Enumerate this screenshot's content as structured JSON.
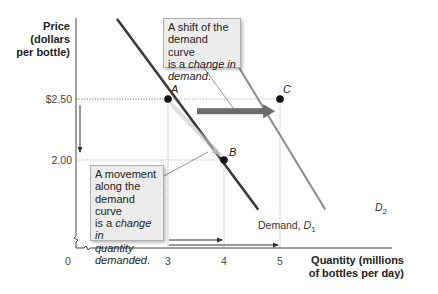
{
  "chart_data": {
    "type": "line",
    "title": "",
    "xlabel": "Quantity (millions of bottles per day)",
    "xlabel_lines": [
      "Quantity (millions",
      "of bottles per day)"
    ],
    "ylabel": "Price (dollars per bottle)",
    "ylabel_lines": [
      "Price",
      "(dollars",
      "per bottle)"
    ],
    "origin_label": "0",
    "x_ticks": [
      {
        "value": 3,
        "label": "3"
      },
      {
        "value": 4,
        "label": "4"
      },
      {
        "value": 5,
        "label": "5"
      }
    ],
    "y_ticks": [
      {
        "value": 2.5,
        "label": "$2.50"
      },
      {
        "value": 2.0,
        "label": "2.00"
      }
    ],
    "xlim": [
      0,
      7
    ],
    "ylim": [
      1.5,
      3.0
    ],
    "axis_break": true,
    "grid": false,
    "series": [
      {
        "name": "Demand, D1",
        "label_text": "Demand, ",
        "label_symbol": "D",
        "label_sub": "1",
        "color": "#3a3a3a",
        "points": [
          [
            2.1,
            3.15
          ],
          [
            4.6,
            1.6
          ]
        ]
      },
      {
        "name": "D2",
        "label_text": "",
        "label_symbol": "D",
        "label_sub": "2",
        "color": "#8f8f8f",
        "points": [
          [
            3.75,
            3.15
          ],
          [
            5.8,
            1.6
          ]
        ]
      }
    ],
    "points": [
      {
        "label": "A",
        "x": 3,
        "y": 2.5
      },
      {
        "label": "B",
        "x": 4,
        "y": 2.0
      },
      {
        "label": "C",
        "x": 5,
        "y": 2.5
      }
    ],
    "arrows": [
      {
        "name": "shift-arrow",
        "from": [
          3.5,
          2.4
        ],
        "to": [
          4.95,
          2.4
        ],
        "style": "thick"
      },
      {
        "name": "price-drop-arrow",
        "axis": "y",
        "from": 2.45,
        "to": 2.05
      },
      {
        "name": "quantity-3-to-4-arrow",
        "axis": "x",
        "from": 3,
        "to": 4
      },
      {
        "name": "quantity-3-to-5-arrow",
        "axis": "x",
        "from": 3,
        "to": 5
      }
    ],
    "annotations": [
      {
        "name": "shift-callout",
        "text_plain": "A shift of the demand curve is a ",
        "text_italic": "change in demand",
        "text_end": "."
      },
      {
        "name": "movement-callout",
        "text_plain": "A movement along the demand curve is a ",
        "text_italic": "change in quantity demanded",
        "text_end": "."
      }
    ]
  },
  "callouts": {
    "shift": {
      "l1": "A shift of the",
      "l2": "demand curve",
      "l3a": "is a ",
      "l3b": "change in",
      "l4a": "demand",
      "l4b": "."
    },
    "movement": {
      "l1": "A movement",
      "l2": "along the",
      "l3": "demand curve",
      "l4a": "is a ",
      "l4b": "change in",
      "l5": "quantity",
      "l6a": "demanded",
      "l6b": "."
    }
  }
}
